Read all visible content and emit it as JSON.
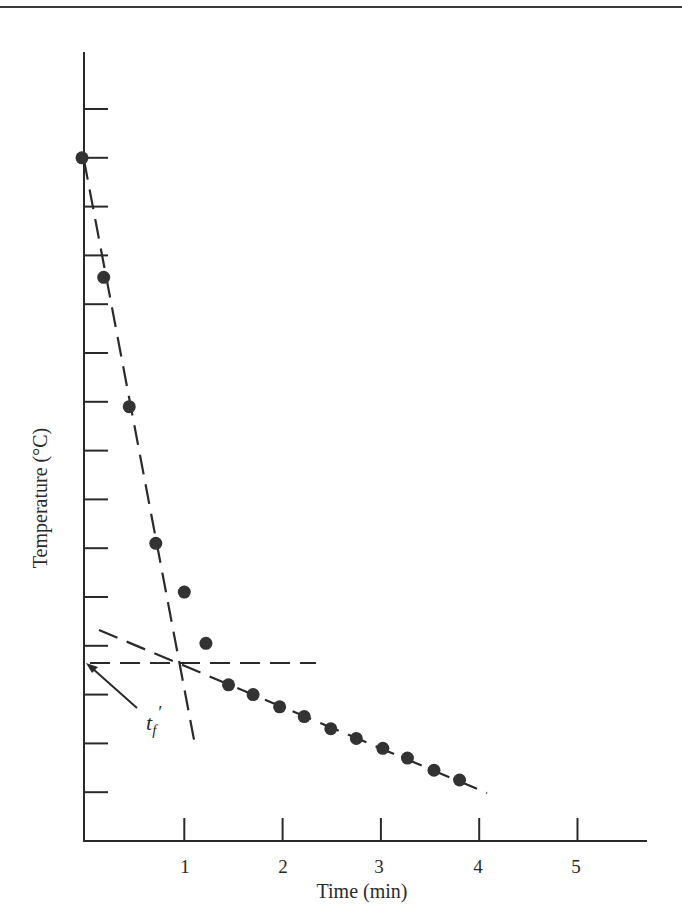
{
  "chart_data": {
    "type": "scatter",
    "title": "",
    "xlabel": "Time (min)",
    "ylabel": "Temperature (°C)",
    "xlim": [
      0,
      5.6
    ],
    "ylim": [
      0,
      16
    ],
    "x_ticks": [
      1,
      2,
      3,
      4,
      5
    ],
    "x_tick_labels": [
      "1",
      "2",
      "3",
      "4",
      "5"
    ],
    "y_ticks_count": 15,
    "y_tick_labels": [],
    "y_units_note": "Y axis has unlabeled ticks; values expressed in tick units above the x-axis",
    "grid": false,
    "legend": null,
    "series": [
      {
        "name": "Measured temperature",
        "marker": "filled-circle",
        "x": [
          0.0,
          0.18,
          0.44,
          0.71,
          1.0,
          1.22,
          1.45,
          1.7,
          1.97,
          2.22,
          2.49,
          2.75,
          3.02,
          3.27,
          3.54,
          3.8
        ],
        "y": [
          14.0,
          11.55,
          8.9,
          6.1,
          5.1,
          4.05,
          3.2,
          3.0,
          2.75,
          2.55,
          2.3,
          2.1,
          1.9,
          1.7,
          1.45,
          1.25
        ]
      }
    ],
    "lines": [
      {
        "name": "fast-cooling-extrapolation",
        "style": "dashed",
        "from": [
          0.0,
          14.0
        ],
        "to": [
          1.1,
          1.95
        ]
      },
      {
        "name": "slow-cooling-extrapolation",
        "style": "dashed",
        "from": [
          0.13,
          4.35
        ],
        "to": [
          4.07,
          0.98
        ]
      },
      {
        "name": "intersection-level",
        "style": "dashed",
        "from": [
          0.0,
          3.65
        ],
        "to": [
          2.34,
          3.65
        ]
      }
    ],
    "annotations": [
      {
        "text": "t",
        "subscript": "f",
        "prime": "′",
        "points_to": [
          0.0,
          3.65
        ],
        "label_at": [
          0.66,
          2.5
        ]
      }
    ],
    "colors": {
      "ink": "#2a2a2a",
      "background": "#ffffff"
    }
  },
  "labels": {
    "x_axis": "Time (min)",
    "y_axis": "Temperature (°C)",
    "x_ticks": [
      "1",
      "2",
      "3",
      "4",
      "5"
    ],
    "annotation_main": "t",
    "annotation_sub": "f",
    "annotation_prime": "′"
  }
}
